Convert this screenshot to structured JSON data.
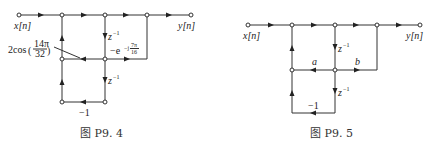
{
  "figures": [
    {
      "caption": "图 P9. 4",
      "input_label": "x[n]",
      "output_label": "y[n]",
      "gains": {
        "cos_prefix": "2cos",
        "cos_num": "14π",
        "cos_den": "32",
        "delay_upper": "z",
        "delay_upper_exp": "−1",
        "delay_lower": "z",
        "delay_lower_exp": "−1",
        "exp_coeff": "−e",
        "exp_power": "−j",
        "exp_num": "7π",
        "exp_den": "16",
        "feedback": "−1"
      }
    },
    {
      "caption": "图 P9. 5",
      "input_label": "x[n]",
      "output_label": "y[n]",
      "gains": {
        "delay_upper": "z",
        "delay_upper_exp": "−1",
        "delay_lower": "z",
        "delay_lower_exp": "−1",
        "a": "a",
        "b": "b",
        "feedback": "−1"
      }
    }
  ]
}
